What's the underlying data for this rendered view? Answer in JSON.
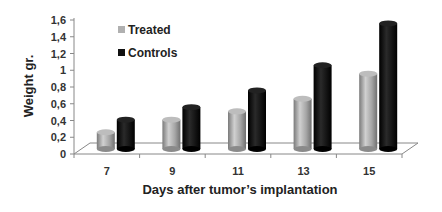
{
  "chart_data": {
    "type": "bar",
    "style": "3d-cylinder",
    "title": "",
    "xlabel": "Days after tumor’s implantation",
    "ylabel": "Weight gr.",
    "categories": [
      "7",
      "9",
      "11",
      "13",
      "15"
    ],
    "series": [
      {
        "name": "Treated",
        "color": "#a8a8a8",
        "values": [
          0.2,
          0.35,
          0.45,
          0.6,
          0.9
        ]
      },
      {
        "name": "Controls",
        "color": "#111111",
        "values": [
          0.35,
          0.5,
          0.7,
          1.0,
          1.5
        ]
      }
    ],
    "ylim": [
      0,
      1.6
    ],
    "yticks": [
      "0",
      "0,2",
      "0,4",
      "0,6",
      "0,8",
      "1",
      "1,2",
      "1,4",
      "1,6"
    ],
    "grid": false,
    "legend_position": "top-left inside"
  }
}
